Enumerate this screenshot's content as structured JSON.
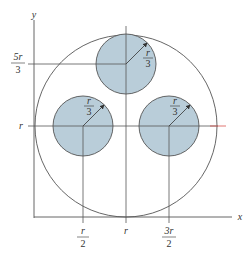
{
  "diagram": {
    "colors": {
      "small_circle_fill": "#b9cdd9",
      "line": "#555555",
      "highlight_line": "#d9534f",
      "background": "#ffffff"
    },
    "axes": {
      "x_label": "x",
      "y_label": "y"
    },
    "big_circle": {
      "center": "(r, r)",
      "radius": "r"
    },
    "small_circles": [
      {
        "name": "top",
        "center": "(r, 5r/3)",
        "radius_label_num": "r",
        "radius_label_den": "3"
      },
      {
        "name": "left",
        "center": "(r/2, r)",
        "radius_label_num": "r",
        "radius_label_den": "3"
      },
      {
        "name": "right",
        "center": "(3r/2, r)",
        "radius_label_num": "r",
        "radius_label_den": "3"
      }
    ],
    "y_ticks": [
      {
        "num": "5r",
        "den": "3"
      },
      {
        "label": "r"
      }
    ],
    "x_ticks": [
      {
        "num": "r",
        "den": "2"
      },
      {
        "label": "r"
      },
      {
        "num": "3r",
        "den": "2"
      }
    ]
  }
}
